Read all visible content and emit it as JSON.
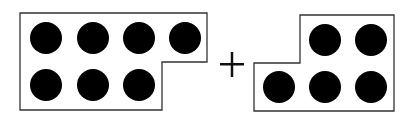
{
  "figure": {
    "left_group": {
      "count": 7,
      "top_row": 4,
      "bottom_row": 3
    },
    "operator": "+",
    "right_group": {
      "count": 5,
      "top_row": 2,
      "bottom_row": 3
    },
    "colors": {
      "dot": "#000000",
      "outline": "#333333",
      "background": "#ffffff"
    }
  }
}
